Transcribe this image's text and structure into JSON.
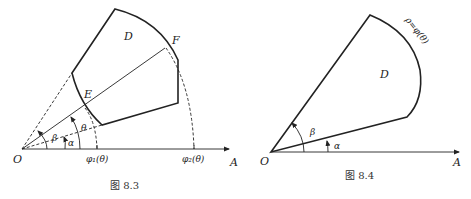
{
  "figures": [
    {
      "id": "fig-8-3",
      "caption": "图 8.3",
      "labels": {
        "origin": "O",
        "axis_end": "A",
        "region": "D",
        "point_E": "E",
        "point_F": "F",
        "angle_alpha": "α",
        "angle_beta": "β",
        "angle_theta": "θ",
        "phi1": "φ₁(θ)",
        "phi2": "φ₂(θ)"
      }
    },
    {
      "id": "fig-8-4",
      "caption": "图 8.4",
      "labels": {
        "origin": "O",
        "axis_end": "A",
        "region": "D",
        "angle_alpha": "α",
        "angle_beta": "β",
        "curve": "ρ=φ(θ)"
      }
    }
  ],
  "colors": {
    "stroke": "#222222",
    "background": "#ffffff"
  }
}
